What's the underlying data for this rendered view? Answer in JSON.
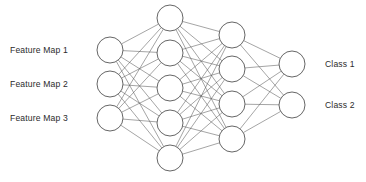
{
  "diagram": {
    "type": "fully-connected-feedforward",
    "background_color": "#ffffff",
    "node_fill": "#ffffff",
    "node_stroke": "#4a4a4a",
    "edge_stroke": "#5a5a5a",
    "text_color": "#2b2b2b",
    "width": 366,
    "height": 182,
    "layers": [
      {
        "id": "input-layer",
        "name": "Input Layer",
        "node_count": 3,
        "cx": 110,
        "radius": 13,
        "node_cy": [
          50,
          84,
          118
        ],
        "labels_side": "left"
      },
      {
        "id": "hidden-layer-1",
        "name": "Hidden Layer 1",
        "node_count": 5,
        "cx": 170,
        "radius": 13,
        "node_cy": [
          18,
          53,
          88,
          123,
          158
        ],
        "labels_side": "none"
      },
      {
        "id": "hidden-layer-2",
        "name": "Hidden Layer 2",
        "node_count": 4,
        "cx": 232,
        "radius": 13,
        "node_cy": [
          35,
          69,
          104,
          139
        ],
        "labels_side": "none"
      },
      {
        "id": "output-layer",
        "name": "Output Layer",
        "node_count": 2,
        "cx": 292,
        "radius": 13,
        "node_cy": [
          64,
          105
        ],
        "labels_side": "right"
      }
    ],
    "connections": [
      {
        "from": "input-layer",
        "to": "hidden-layer-1",
        "fully_connected": true
      },
      {
        "from": "hidden-layer-1",
        "to": "hidden-layer-2",
        "fully_connected": true
      },
      {
        "from": "hidden-layer-2",
        "to": "output-layer",
        "fully_connected": true
      }
    ],
    "input_labels": [
      {
        "text": "Feature Map 1",
        "x": 10,
        "y": 53
      },
      {
        "text": "Feature Map 2",
        "x": 10,
        "y": 87
      },
      {
        "text": "Feature Map 3",
        "x": 10,
        "y": 121
      }
    ],
    "output_labels": [
      {
        "text": "Class 1",
        "x": 325,
        "y": 67
      },
      {
        "text": "Class 2",
        "x": 325,
        "y": 108
      }
    ]
  }
}
